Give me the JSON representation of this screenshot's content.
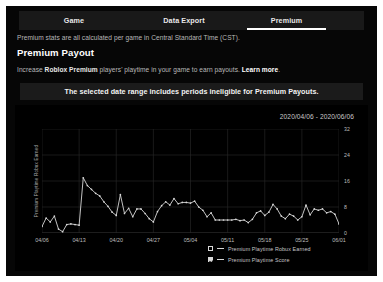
{
  "tabs": [
    {
      "label": "Game",
      "active": false
    },
    {
      "label": "Data Export",
      "active": false
    },
    {
      "label": "Premium",
      "active": true
    }
  ],
  "note": "Premium stats are all calculated per game in Central Standard Time (CST).",
  "section_title": "Premium Payout",
  "subnote": {
    "part1": "Increase ",
    "bold": "Roblox Premium",
    "part2": " players' playtime in your game to earn payouts. ",
    "link": "Learn more",
    "part3": "."
  },
  "banner": "The selected date range includes periods ineligible for Premium Payouts.",
  "date_range": "2020/04/06 - 2020/06/06",
  "legend": [
    {
      "label": "Premium Playtime Robux Earned",
      "checked": false
    },
    {
      "label": "Premium Playtime Score",
      "checked": true
    }
  ],
  "colors": {
    "page_bg": "#060606",
    "card_bg": "#000000",
    "tabbar_bg": "#191919",
    "banner_bg": "#1b1b1b",
    "line": "#d8d8d8",
    "grid": "#2a2a2a",
    "text_muted": "#b9b9b9"
  },
  "chart_data": {
    "type": "line",
    "title": "",
    "xlabel": "",
    "ylabel": "Premium Playtime Robux Earned",
    "y2label": "Premium Playtime Score",
    "grid": true,
    "legend_position": "bottom-right",
    "x_ticks": [
      "04/06",
      "04/13",
      "04/20",
      "04/27",
      "05/04",
      "05/11",
      "05/18",
      "05/25",
      "06/01"
    ],
    "y2_ticks": [
      0,
      8,
      16,
      24,
      32
    ],
    "ylim": [
      0,
      32
    ],
    "series": [
      {
        "name": "Premium Playtime Score",
        "visible": true,
        "values": [
          2.0,
          4.6,
          3.4,
          5.2,
          1.2,
          0.4,
          2.6,
          2.8,
          2.6,
          2.4,
          17.0,
          14.6,
          13.4,
          12.2,
          11.4,
          9.6,
          8.2,
          6.4,
          5.4,
          11.8,
          6.0,
          7.6,
          5.0,
          7.4,
          7.4,
          6.0,
          4.4,
          3.4,
          6.6,
          8.4,
          9.6,
          8.6,
          10.6,
          9.0,
          9.4,
          9.4,
          9.2,
          9.8,
          8.0,
          7.0,
          5.0,
          6.2,
          4.0,
          4.0,
          4.0,
          4.0,
          4.0,
          4.2,
          3.8,
          4.0,
          3.2,
          4.2,
          6.2,
          6.8,
          5.4,
          6.4,
          8.8,
          7.4,
          5.2,
          4.4,
          5.8,
          5.2,
          4.0,
          5.0,
          8.6,
          5.6,
          7.4,
          7.0,
          7.4,
          6.2,
          6.6,
          5.8,
          2.8
        ]
      },
      {
        "name": "Premium Playtime Robux Earned",
        "visible": false,
        "values": []
      }
    ]
  }
}
